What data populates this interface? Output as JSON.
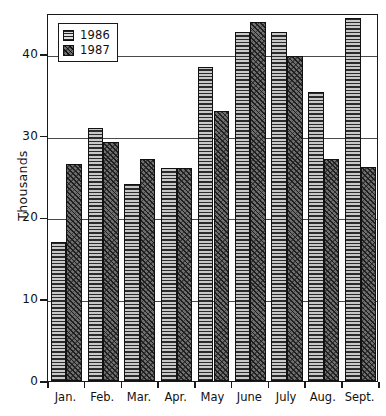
{
  "chart_data": {
    "type": "bar",
    "title": "",
    "xlabel": "",
    "ylabel": "Thousands",
    "categories": [
      "Jan.",
      "Feb.",
      "Mar.",
      "Apr.",
      "May",
      "June",
      "July",
      "Aug.",
      "Sept."
    ],
    "series": [
      {
        "name": "1986",
        "values": [
          17.0,
          30.9,
          24.1,
          26.1,
          38.4,
          42.7,
          42.7,
          35.4,
          44.4
        ]
      },
      {
        "name": "1987",
        "values": [
          26.6,
          29.2,
          27.1,
          26.1,
          33.0,
          43.9,
          39.7,
          27.1,
          26.2
        ]
      }
    ],
    "ylim": [
      0,
      45
    ],
    "yticks": [
      0,
      10,
      20,
      30,
      40
    ],
    "ytick_labels": [
      "0",
      "10",
      "20",
      "30",
      "40"
    ],
    "grid": true,
    "grid_axis": "y",
    "legend_position": "top-left",
    "legend_entries": [
      "1986",
      "1987"
    ]
  },
  "legend": {
    "items": [
      {
        "label": "1986",
        "swatch": "horizontal-line-hatch-swatch"
      },
      {
        "label": "1987",
        "swatch": "diagonal-crosshatch-swatch"
      }
    ]
  },
  "axes": {
    "y_axis_title": "Thousands"
  }
}
